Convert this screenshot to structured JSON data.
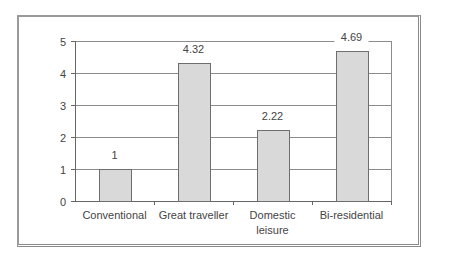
{
  "chart_data": {
    "type": "bar",
    "title": "",
    "xlabel": "",
    "ylabel": "",
    "categories": [
      "Conventional",
      "Great traveller",
      "Domestic leisure",
      "Bi-residential"
    ],
    "category_lines": [
      [
        "Conventional"
      ],
      [
        "Great traveller"
      ],
      [
        "Domestic",
        "leisure"
      ],
      [
        "Bi-residential"
      ]
    ],
    "values": [
      1,
      4.32,
      2.22,
      4.69
    ],
    "value_labels": [
      "1",
      "4.32",
      "2.22",
      "4.69"
    ],
    "ylim": [
      0,
      5
    ],
    "yticks": [
      0,
      1,
      2,
      3,
      4,
      5
    ],
    "ytick_labels": [
      "0",
      "1",
      "2",
      "3",
      "4",
      "5"
    ],
    "grid": true,
    "legend": null,
    "colors": {
      "bar_fill": "#d9d9d9",
      "bar_stroke": "#6e6e6e",
      "grid": "#8c8c8c",
      "axis": "#666666",
      "frame": "#8a8a8a"
    }
  }
}
